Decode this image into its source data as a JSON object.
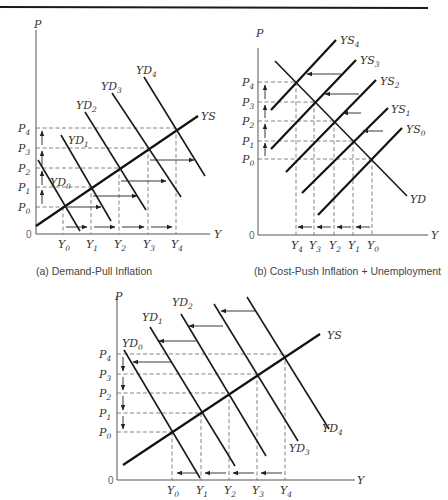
{
  "diagrams": [
    {
      "id": "a",
      "caption": "(a) Demand-Pull Inflation",
      "axis_y_label": "P",
      "axis_x_label": "Y",
      "origin_label": "0",
      "price_levels": [
        "P0",
        "P1",
        "P2",
        "P3",
        "P4"
      ],
      "output_levels": [
        "Y0",
        "Y1",
        "Y2",
        "Y3",
        "Y4"
      ],
      "supply_curves": [
        "YS"
      ],
      "demand_curves": [
        "YD0",
        "YD1",
        "YD2",
        "YD3",
        "YD4"
      ],
      "shift": "demand curves shift right, price rises, output rises"
    },
    {
      "id": "b",
      "caption": "(b) Cost-Push Inflation + Unemployment",
      "axis_y_label": "P",
      "axis_x_label": "Y",
      "origin_label": "0",
      "price_levels": [
        "P0",
        "P1",
        "P2",
        "P3",
        "P4"
      ],
      "output_levels": [
        "Y4",
        "Y3",
        "Y2",
        "Y1",
        "Y0"
      ],
      "supply_curves": [
        "YS0",
        "YS1",
        "YS2",
        "YS3",
        "YS4"
      ],
      "demand_curves": [
        "YD"
      ],
      "shift": "supply curves shift left, price rises, output falls"
    },
    {
      "id": "c",
      "caption": "",
      "axis_y_label": "P",
      "axis_x_label": "Y",
      "origin_label": "0",
      "price_levels": [
        "P0",
        "P1",
        "P2",
        "P3",
        "P4"
      ],
      "output_levels": [
        "Y0",
        "Y1",
        "Y2",
        "Y3",
        "Y4"
      ],
      "supply_curves": [
        "YS"
      ],
      "demand_curves": [
        "YD0",
        "YD1",
        "YD2",
        "YD3",
        "YD4"
      ],
      "shift": "demand curves shift left, price falls, output falls"
    }
  ]
}
